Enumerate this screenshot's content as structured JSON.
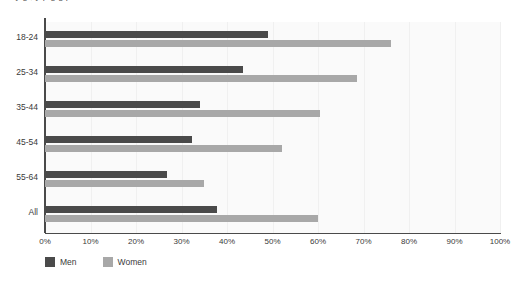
{
  "clipped_headline": "a a    y            g   ,  y    p  g  g  p",
  "legend": {
    "position": "bottom-left",
    "items": [
      {
        "label": "Men",
        "color": "#4a4a4a",
        "swatch_name": "legend-swatch-men"
      },
      {
        "label": "Women",
        "color": "#a8a8a8",
        "swatch_name": "legend-swatch-women"
      }
    ]
  },
  "colors": {
    "men": "#4a4a4a",
    "women": "#a8a8a8",
    "plot_background": "#fafafa",
    "gridline": "#f0f0f0",
    "axis": "#4a4a4a",
    "text": "#3a3a3a"
  },
  "chart_data": {
    "type": "bar",
    "orientation": "horizontal",
    "title": "",
    "subtitle": "",
    "xlabel": "",
    "ylabel": "",
    "xlim": [
      0,
      100
    ],
    "xunit": "%",
    "grid": true,
    "grid_axis": "x",
    "legend_position": "bottom-left",
    "categories": [
      "18-24",
      "25-34",
      "35-44",
      "45-54",
      "55-64",
      "All"
    ],
    "xticks": [
      0,
      10,
      20,
      30,
      40,
      50,
      60,
      70,
      80,
      90,
      100
    ],
    "xticklabels": [
      "0%",
      "10%",
      "20%",
      "30%",
      "40%",
      "50%",
      "60%",
      "70%",
      "80%",
      "90%",
      "100%"
    ],
    "series": [
      {
        "name": "Men",
        "color": "#4a4a4a",
        "values": [
          49,
          43.5,
          34,
          32.3,
          26.8,
          37.8
        ]
      },
      {
        "name": "Women",
        "color": "#a8a8a8",
        "values": [
          76,
          68.5,
          60.5,
          52,
          35,
          60
        ]
      }
    ]
  }
}
